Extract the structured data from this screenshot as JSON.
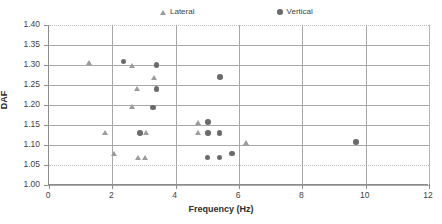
{
  "chart_data": {
    "type": "scatter",
    "title": "",
    "xlabel": "Frequency (Hz)",
    "ylabel": "DAF",
    "xlim": [
      0,
      12
    ],
    "ylim": [
      1.0,
      1.4
    ],
    "xticks": [
      "0",
      "2",
      "4",
      "6",
      "8",
      "10",
      "12"
    ],
    "yticks": [
      "1.00",
      "1.05",
      "1.10",
      "1.15",
      "1.20",
      "1.25",
      "1.30",
      "1.35",
      "1.40"
    ],
    "xtick_values": [
      0,
      2,
      4,
      6,
      8,
      10,
      12
    ],
    "ytick_values": [
      1.0,
      1.05,
      1.1,
      1.15,
      1.2,
      1.25,
      1.3,
      1.35,
      1.4
    ],
    "grid": "horizontal and vertical gridlines at major ticks",
    "legend_position": "top-center",
    "series": [
      {
        "name": "Lateral",
        "marker": "triangle",
        "color": "#9b9b9b",
        "points": [
          {
            "x": 1.28,
            "y": 1.305
          },
          {
            "x": 2.62,
            "y": 1.299
          },
          {
            "x": 3.32,
            "y": 1.268
          },
          {
            "x": 2.8,
            "y": 1.24
          },
          {
            "x": 2.62,
            "y": 1.195
          },
          {
            "x": 4.7,
            "y": 1.157
          },
          {
            "x": 1.78,
            "y": 1.13
          },
          {
            "x": 3.08,
            "y": 1.13
          },
          {
            "x": 4.7,
            "y": 1.13
          },
          {
            "x": 6.22,
            "y": 1.107
          },
          {
            "x": 2.05,
            "y": 1.079
          },
          {
            "x": 2.82,
            "y": 1.069
          },
          {
            "x": 3.05,
            "y": 1.069
          }
        ]
      },
      {
        "name": "Vertical",
        "marker": "circle",
        "color": "#6b6b6b",
        "points": [
          {
            "x": 2.35,
            "y": 1.309
          },
          {
            "x": 3.4,
            "y": 1.3
          },
          {
            "x": 5.4,
            "y": 1.27
          },
          {
            "x": 3.4,
            "y": 1.24
          },
          {
            "x": 3.28,
            "y": 1.194
          },
          {
            "x": 5.02,
            "y": 1.158
          },
          {
            "x": 2.88,
            "y": 1.13
          },
          {
            "x": 5.02,
            "y": 1.13
          },
          {
            "x": 5.38,
            "y": 1.13
          },
          {
            "x": 9.7,
            "y": 1.108
          },
          {
            "x": 5.78,
            "y": 1.079
          },
          {
            "x": 5.0,
            "y": 1.069
          },
          {
            "x": 5.38,
            "y": 1.069
          }
        ]
      }
    ]
  },
  "legend": {
    "lateral_label": "Lateral",
    "vertical_label": "Vertical"
  },
  "axes": {
    "x_title": "Frequency (Hz)",
    "y_title": "DAF"
  }
}
